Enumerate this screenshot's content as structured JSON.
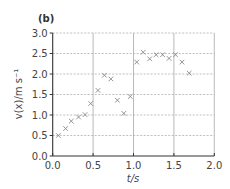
{
  "panel_label": "(b)",
  "chart_data": {
    "type": "scatter",
    "title": "(b)",
    "xlabel": "t/s",
    "ylabel": "v(x)/m s⁻¹",
    "xlim": [
      0,
      2.0
    ],
    "ylim": [
      0,
      3.0
    ],
    "xticks": [
      "0.0",
      "0.5",
      "1.0",
      "1.5",
      "2.0"
    ],
    "yticks": [
      "0.0",
      "0.5",
      "1.0",
      "1.5",
      "2.0",
      "2.5",
      "3.0"
    ],
    "grid": true,
    "marker": "x",
    "marker_color": "#888888",
    "series": [
      {
        "name": "v(x)",
        "x": [
          0.07,
          0.16,
          0.23,
          0.32,
          0.4,
          0.47,
          0.56,
          0.64,
          0.72,
          0.8,
          0.88,
          0.96,
          1.04,
          1.12,
          1.2,
          1.28,
          1.36,
          1.44,
          1.52,
          1.6,
          1.69
        ],
        "y": [
          0.5,
          0.67,
          0.85,
          0.95,
          1.01,
          1.28,
          1.6,
          1.97,
          1.88,
          1.36,
          1.04,
          1.45,
          2.29,
          2.53,
          2.37,
          2.47,
          2.47,
          2.38,
          2.47,
          2.29,
          2.02
        ]
      }
    ]
  }
}
